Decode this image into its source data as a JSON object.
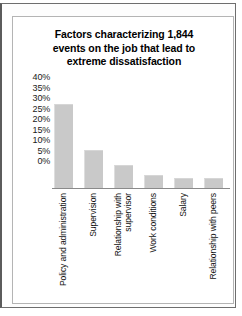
{
  "chart_data": {
    "type": "bar",
    "title": "Factors characterizing 1,844 events on the job that lead to extreme dissatisfaction",
    "title_lines": [
      "Factors characterizing 1,844",
      "events on the job that lead to",
      "extreme dissatisfaction"
    ],
    "categories": [
      "Policy and administration",
      "Supervision",
      "Relationship with supervisor",
      "Work conditions",
      "Salary",
      "Relationship with peers"
    ],
    "category_lines": [
      [
        "Policy and administration"
      ],
      [
        "Supervision"
      ],
      [
        "Relationship with",
        "supervisor"
      ],
      [
        "Work conditions"
      ],
      [
        "Salary"
      ],
      [
        "Relationship with peers"
      ]
    ],
    "values": [
      40,
      18,
      11,
      6,
      5,
      5
    ],
    "xlabel": "",
    "ylabel": "",
    "ylim": [
      0,
      40
    ],
    "ytick_values": [
      40,
      35,
      30,
      25,
      20,
      15,
      10,
      5,
      0
    ],
    "ytick_labels": [
      "40%",
      "35%",
      "30%",
      "25%",
      "20%",
      "15%",
      "10%",
      "5%",
      "0%"
    ],
    "grid": false,
    "legend": false,
    "bar_color": "#c9c9c9",
    "axis_color": "#8a8a8a",
    "text_color": "#111111"
  }
}
